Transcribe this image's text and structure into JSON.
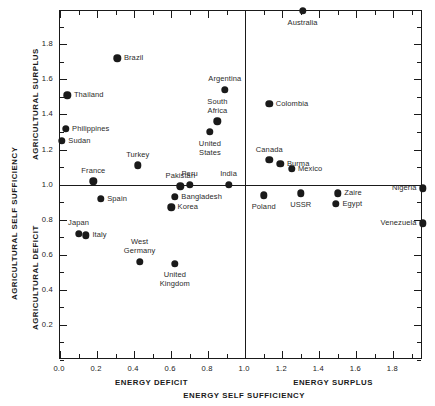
{
  "chart_data": {
    "type": "scatter",
    "title": "",
    "xlabel": "ENERGY SELF SUFFICIENCY",
    "ylabel": "AGRICULTURAL SELF SUFFICIENCY",
    "xlim": [
      0.0,
      1.96
    ],
    "ylim": [
      0.0,
      1.99
    ],
    "grid": false,
    "legend": "none",
    "reference_lines": {
      "x": 1.0,
      "y": 1.0
    },
    "x_quadrant_labels": {
      "low": "ENERGY DEFICIT",
      "high": "ENERGY SURPLUS"
    },
    "y_quadrant_labels": {
      "high": "AGRICULTURAL SURPLUS",
      "low": "AGRICULTURAL DEFICIT"
    },
    "xticks": [
      0.0,
      0.2,
      0.4,
      0.6,
      0.8,
      1.0,
      1.2,
      1.4,
      1.6,
      1.8
    ],
    "xticklabels": [
      "0.0",
      "0.2",
      "0.4",
      "0.6",
      "0.8",
      "1.0",
      "1.2",
      "1.4",
      "1.6",
      "1.8"
    ],
    "yticks": [
      0.2,
      0.4,
      0.6,
      0.8,
      1.0,
      1.2,
      1.4,
      1.6,
      1.8
    ],
    "yticklabels": [
      "0.2",
      "0.4",
      "0.6",
      "0.8",
      "1.0",
      "1.2",
      "1.4",
      "1.6",
      "1.8"
    ],
    "x_minor_step": 0.1,
    "y_minor_step": 0.1,
    "points": [
      {
        "name": "Australia",
        "x": 1.31,
        "y": 1.99,
        "label_pos": "below"
      },
      {
        "name": "Brazil",
        "x": 0.31,
        "y": 1.72,
        "label_pos": "right"
      },
      {
        "name": "Argentina",
        "x": 0.89,
        "y": 1.54,
        "label_pos": "above"
      },
      {
        "name": "Thailand",
        "x": 0.04,
        "y": 1.51,
        "label_pos": "right"
      },
      {
        "name": "Colombia",
        "x": 1.13,
        "y": 1.46,
        "label_pos": "right"
      },
      {
        "name": "South Africa",
        "x": 0.85,
        "y": 1.36,
        "label_pos": "above"
      },
      {
        "name": "Philippines",
        "x": 0.03,
        "y": 1.32,
        "label_pos": "right"
      },
      {
        "name": "United States",
        "x": 0.81,
        "y": 1.3,
        "label_pos": "below"
      },
      {
        "name": "Sudan",
        "x": 0.01,
        "y": 1.25,
        "label_pos": "right"
      },
      {
        "name": "Turkey",
        "x": 0.42,
        "y": 1.11,
        "label_pos": "above"
      },
      {
        "name": "Canada",
        "x": 1.13,
        "y": 1.14,
        "label_pos": "above"
      },
      {
        "name": "Burma",
        "x": 1.19,
        "y": 1.12,
        "label_pos": "right"
      },
      {
        "name": "Mexico",
        "x": 1.25,
        "y": 1.09,
        "label_pos": "right"
      },
      {
        "name": "India",
        "x": 0.91,
        "y": 1.0,
        "label_pos": "above"
      },
      {
        "name": "Peru",
        "x": 0.7,
        "y": 1.0,
        "label_pos": "above"
      },
      {
        "name": "Pakistan",
        "x": 0.65,
        "y": 0.99,
        "label_pos": "above"
      },
      {
        "name": "France",
        "x": 0.18,
        "y": 1.02,
        "label_pos": "above"
      },
      {
        "name": "Nigeria",
        "x": 1.96,
        "y": 0.98,
        "label_pos": "left"
      },
      {
        "name": "Zaire",
        "x": 1.5,
        "y": 0.95,
        "label_pos": "right"
      },
      {
        "name": "Poland",
        "x": 1.1,
        "y": 0.94,
        "label_pos": "below"
      },
      {
        "name": "USSR",
        "x": 1.3,
        "y": 0.95,
        "label_pos": "below"
      },
      {
        "name": "Bangladesh",
        "x": 0.62,
        "y": 0.93,
        "label_pos": "right"
      },
      {
        "name": "Egypt",
        "x": 1.49,
        "y": 0.89,
        "label_pos": "right"
      },
      {
        "name": "Spain",
        "x": 0.22,
        "y": 0.92,
        "label_pos": "right"
      },
      {
        "name": "Korea",
        "x": 0.6,
        "y": 0.87,
        "label_pos": "right"
      },
      {
        "name": "Venezuela",
        "x": 1.96,
        "y": 0.78,
        "label_pos": "left"
      },
      {
        "name": "Japan",
        "x": 0.1,
        "y": 0.72,
        "label_pos": "above"
      },
      {
        "name": "Italy",
        "x": 0.14,
        "y": 0.71,
        "label_pos": "right"
      },
      {
        "name": "West Germany",
        "x": 0.43,
        "y": 0.56,
        "label_pos": "above"
      },
      {
        "name": "United Kingdom",
        "x": 0.62,
        "y": 0.55,
        "label_pos": "below"
      }
    ]
  }
}
